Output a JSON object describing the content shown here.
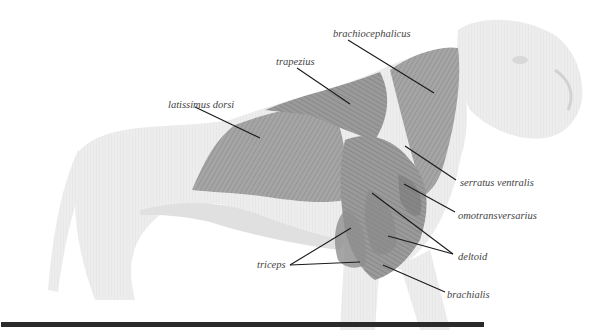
{
  "figure": {
    "colors": {
      "background": "#ffffff",
      "body_fill": "#ececec",
      "body_shade": "#dcdcdc",
      "muscle_fill": "#9c9c9c",
      "muscle_dark": "#7a7a7a",
      "leader_line": "#1a1a1a",
      "label_text": "#444444",
      "bottom_bar": "#2a2a2a"
    },
    "labels": [
      {
        "id": "latissimus-dorsi",
        "text": "latissimus dorsi",
        "x": 168,
        "y": 100
      },
      {
        "id": "trapezius",
        "text": "trapezius",
        "x": 276,
        "y": 57
      },
      {
        "id": "brachiocephalicus",
        "text": "brachiocephalicus",
        "x": 333,
        "y": 29
      },
      {
        "id": "serratus-ventralis",
        "text": "serratus ventralis",
        "x": 460,
        "y": 178
      },
      {
        "id": "omotransversarius",
        "text": "omotransversarius",
        "x": 458,
        "y": 211
      },
      {
        "id": "deltoid",
        "text": "deltoid",
        "x": 458,
        "y": 252
      },
      {
        "id": "triceps",
        "text": "triceps",
        "x": 257,
        "y": 260
      },
      {
        "id": "brachialis",
        "text": "brachialis",
        "x": 447,
        "y": 290
      }
    ]
  }
}
